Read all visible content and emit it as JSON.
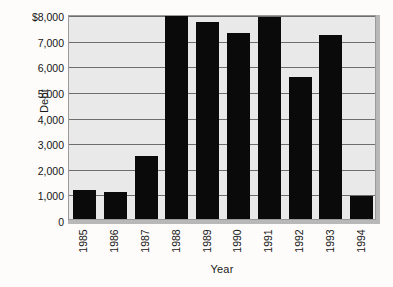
{
  "chart_data": {
    "type": "bar",
    "title": "",
    "xlabel": "Year",
    "ylabel": "Debt",
    "categories": [
      "1985",
      "1986",
      "1987",
      "1988",
      "1989",
      "1990",
      "1991",
      "1992",
      "1993",
      "1994"
    ],
    "values": [
      1150,
      1050,
      2450,
      7950,
      7700,
      7250,
      7900,
      5560,
      7200,
      900
    ],
    "ylim": [
      0,
      8000
    ],
    "ytick_values": [
      0,
      1000,
      2000,
      3000,
      4000,
      5000,
      6000,
      7000,
      8000
    ],
    "ytick_labels": [
      "0",
      "1,000",
      "2,000",
      "3,000",
      "4,000",
      "5,000",
      "6,000",
      "7,000",
      "$8,000"
    ],
    "grid": true,
    "legend": false,
    "legend_position": "none",
    "bar_color": "#0a0a0a",
    "plot_background": "#e9e9e9",
    "gridline_color": "#6e6e6e",
    "figure_background": "#fdfcfa"
  }
}
